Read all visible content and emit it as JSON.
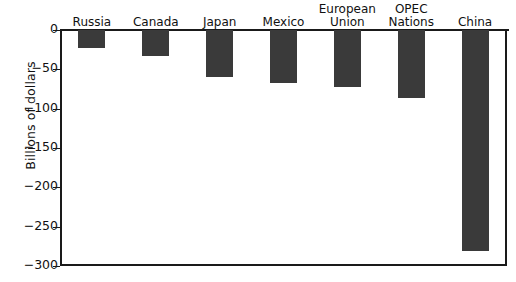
{
  "chart_data": {
    "type": "bar",
    "title": "",
    "subtitle": "",
    "xlabel": "",
    "ylabel": "Billions of dollars",
    "orientation": "vertical",
    "grid": false,
    "legend": "none",
    "ylim": [
      -300,
      0
    ],
    "ytick_values": [
      0,
      -50,
      -100,
      -150,
      -200,
      -250,
      -300
    ],
    "ytick_labels": [
      "0",
      "−50",
      "−100",
      "−150",
      "−200",
      "−250",
      "−300"
    ],
    "categories": [
      "Russia",
      "Canada",
      "Japan",
      "Mexico",
      "European\nUnion",
      "OPEC\nNations",
      "China"
    ],
    "category_labels_display": [
      "Russia",
      "Canada",
      "Japan",
      "Mexico",
      "European Union",
      "OPEC Nations",
      "China"
    ],
    "values": [
      -23,
      -33,
      -60,
      -68,
      -73,
      -87,
      -281
    ],
    "bar_color": "#3a3a3a",
    "axis_color": "#1a1a1a",
    "background_color": "#ffffff"
  },
  "axis": {
    "y_title": "Billions of dollars"
  },
  "ticks": [
    {
      "label": "0",
      "value": 0
    },
    {
      "label": "−50",
      "value": -50
    },
    {
      "label": "−100",
      "value": -100
    },
    {
      "label": "−150",
      "value": -150
    },
    {
      "label": "−200",
      "value": -200
    },
    {
      "label": "−250",
      "value": -250
    },
    {
      "label": "−300",
      "value": -300
    }
  ],
  "bars": [
    {
      "name": "Russia",
      "label_line1": "Russia",
      "label_line2": "",
      "value": -23
    },
    {
      "name": "Canada",
      "label_line1": "Canada",
      "label_line2": "",
      "value": -33
    },
    {
      "name": "Japan",
      "label_line1": "Japan",
      "label_line2": "",
      "value": -60
    },
    {
      "name": "Mexico",
      "label_line1": "Mexico",
      "label_line2": "",
      "value": -68
    },
    {
      "name": "European Union",
      "label_line1": "European",
      "label_line2": "Union",
      "value": -73
    },
    {
      "name": "OPEC Nations",
      "label_line1": "OPEC",
      "label_line2": "Nations",
      "value": -87
    },
    {
      "name": "China",
      "label_line1": "China",
      "label_line2": "",
      "value": -281
    }
  ]
}
